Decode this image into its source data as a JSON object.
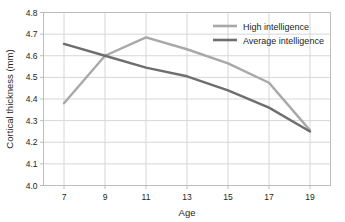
{
  "chart_data": {
    "type": "line",
    "title": "",
    "xlabel": "Age",
    "ylabel": "Cortical thickness (mm)",
    "x": [
      7,
      9,
      11,
      13,
      15,
      17,
      19
    ],
    "xticklabels": [
      "7",
      "9",
      "11",
      "13",
      "15",
      "17",
      "19"
    ],
    "yticklabels": [
      "4.0",
      "4.1",
      "4.2",
      "4.3",
      "4.4",
      "4.5",
      "4.6",
      "4.7",
      "4.8"
    ],
    "yticks": [
      4.0,
      4.1,
      4.2,
      4.3,
      4.4,
      4.5,
      4.6,
      4.7,
      4.8
    ],
    "xlim": [
      6,
      20
    ],
    "ylim": [
      4.0,
      4.8
    ],
    "grid": true,
    "legend_position": "top-right",
    "series": [
      {
        "name": "High intelligence",
        "color": "#a8a8a8",
        "values": [
          4.38,
          4.6,
          4.685,
          4.63,
          4.565,
          4.475,
          4.255
        ]
      },
      {
        "name": "Average intelligence",
        "color": "#6e6e6e",
        "values": [
          4.655,
          4.6,
          4.545,
          4.505,
          4.44,
          4.36,
          4.25
        ]
      }
    ]
  },
  "colors": {
    "grid": "#d6d6d6",
    "frame": "#bdbdbd",
    "text": "#231f20",
    "background": "#ffffff"
  }
}
